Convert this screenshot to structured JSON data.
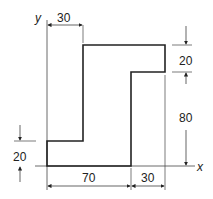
{
  "diagram": {
    "type": "engineering-cross-section",
    "axes": {
      "x_label": "x",
      "y_label": "y"
    },
    "dimensions": {
      "top_offset": "30",
      "top_flange_height": "20",
      "web_height": "80",
      "bottom_flange_height": "20",
      "bottom_width": "70",
      "right_width": "30"
    },
    "colors": {
      "line": "#222222",
      "background": "#ffffff"
    }
  }
}
